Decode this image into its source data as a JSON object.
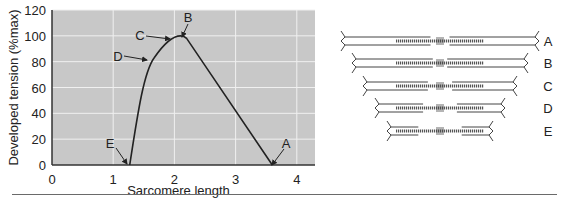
{
  "chart_data": {
    "type": "line",
    "title": "",
    "xlabel": "Sarcomere length",
    "ylabel": "Developed tension (%max)",
    "xlim": [
      0,
      4.3
    ],
    "ylim": [
      0,
      120
    ],
    "xticks": [
      "0",
      "1",
      "2",
      "3",
      "4"
    ],
    "yticks": [
      "0",
      "20",
      "40",
      "60",
      "80",
      "100",
      "120"
    ],
    "grid": true,
    "background": "#c8c8c8",
    "series": [
      {
        "name": "Length-tension curve",
        "x": [
          1.27,
          1.45,
          1.6,
          1.67,
          1.85,
          2.0,
          2.1,
          2.2,
          3.6
        ],
        "y": [
          0,
          55,
          78,
          83,
          93,
          98,
          100,
          98,
          0
        ]
      }
    ],
    "annotations": [
      {
        "label": "A",
        "x": 3.6,
        "y": 0
      },
      {
        "label": "B",
        "x": 2.2,
        "y": 99
      },
      {
        "label": "C",
        "x": 2.0,
        "y": 98
      },
      {
        "label": "D",
        "x": 1.67,
        "y": 83
      },
      {
        "label": "E",
        "x": 1.27,
        "y": 0
      }
    ]
  },
  "diagram": {
    "sarcomeres": [
      {
        "label": "A"
      },
      {
        "label": "B"
      },
      {
        "label": "C"
      },
      {
        "label": "D"
      },
      {
        "label": "E"
      }
    ]
  }
}
